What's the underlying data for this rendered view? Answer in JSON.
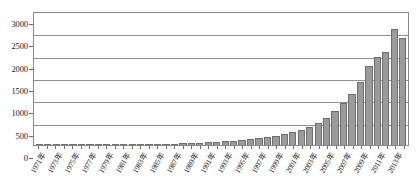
{
  "chart_data": {
    "type": "bar",
    "title": "",
    "subtitle": "",
    "xlabel": "",
    "ylabel": "",
    "ylim": [
      0,
      3000
    ],
    "ytick_values": [
      3000,
      2500,
      2000,
      1500,
      1000,
      500,
      0
    ],
    "ytick_labels": [
      "3000",
      "2500",
      "2000",
      "1500",
      "1000",
      "500",
      "0"
    ],
    "grid": true,
    "legend": null,
    "legend_position": "none",
    "bar_color": "#9a9a9a",
    "bar_border_color": "#6e6e6e",
    "gridline_color": "#8f8f8f",
    "axis_color": "#8a8a8a",
    "xtick_label_interval": 2,
    "xtick_label_rotation": -60,
    "categories": [
      "1971年",
      "1972年",
      "1973年",
      "1974年",
      "1975年",
      "1976年",
      "1977年",
      "1978年",
      "1979年",
      "1980年",
      "1981年",
      "1982年",
      "1983年",
      "1984年",
      "1985年",
      "1986年",
      "1987年",
      "1988年",
      "1989年",
      "1990年",
      "1991年",
      "1992年",
      "1993年",
      "1994年",
      "1995年",
      "1996年",
      "1997年",
      "1998年",
      "1999年",
      "2000年",
      "2001年",
      "2002年",
      "2003年",
      "2004年",
      "2005年",
      "2006年",
      "2007年",
      "2008年",
      "2009年",
      "2010年",
      "2011年",
      "2012年",
      "2013年",
      "2014年"
    ],
    "visible_tick_labels": [
      "1971年",
      "1975年",
      "1980年",
      "1982年",
      "1984年",
      "1986年",
      "1988年",
      "1990年",
      "1992年",
      "1994年",
      "1996年",
      "1998年",
      "2000年",
      "2002年",
      "2004年",
      "2006年",
      "2008年",
      "2010年",
      "2012年",
      "2014年"
    ],
    "values": [
      2,
      3,
      3,
      4,
      5,
      5,
      6,
      8,
      9,
      11,
      13,
      15,
      18,
      20,
      24,
      28,
      33,
      38,
      45,
      52,
      60,
      70,
      82,
      95,
      110,
      128,
      150,
      175,
      205,
      240,
      285,
      340,
      410,
      500,
      610,
      760,
      930,
      1150,
      1420,
      1760,
      1960,
      2080,
      2600,
      2400
    ]
  }
}
